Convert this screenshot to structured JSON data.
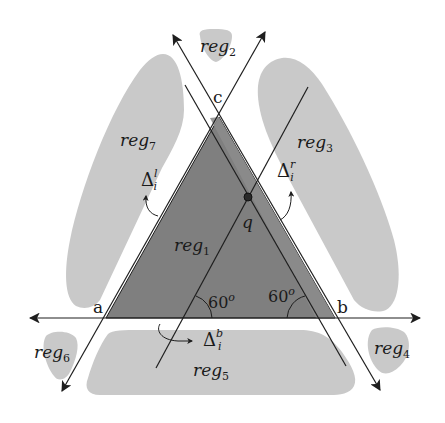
{
  "diagram": {
    "type": "geometric-construction",
    "colors": {
      "background": "#ffffff",
      "region_fill": "#c9c9c9",
      "triangle_fill": "#7f7f7f",
      "triangle_inner_fill": "#8c8c8c",
      "line": "#1e1e1e"
    },
    "vertices": {
      "a": {
        "label": "a",
        "x": 106,
        "y": 318
      },
      "b": {
        "label": "b",
        "x": 335,
        "y": 318
      },
      "c": {
        "label": "c",
        "x": 219,
        "y": 117
      }
    },
    "point_q": {
      "label": "q",
      "x": 248,
      "y": 197
    },
    "regions": [
      {
        "id": "reg1",
        "base": "reg",
        "sub": "1"
      },
      {
        "id": "reg2",
        "base": "reg",
        "sub": "2"
      },
      {
        "id": "reg3",
        "base": "reg",
        "sub": "3"
      },
      {
        "id": "reg4",
        "base": "reg",
        "sub": "4"
      },
      {
        "id": "reg5",
        "base": "reg",
        "sub": "5"
      },
      {
        "id": "reg6",
        "base": "reg",
        "sub": "6"
      },
      {
        "id": "reg7",
        "base": "reg",
        "sub": "7"
      }
    ],
    "deltas": [
      {
        "id": "delta-left",
        "base": "Δ",
        "sub": "i",
        "sup": "l"
      },
      {
        "id": "delta-right",
        "base": "Δ",
        "sub": "i",
        "sup": "r"
      },
      {
        "id": "delta-bottom",
        "base": "Δ",
        "sub": "i",
        "sup": "b"
      }
    ],
    "angles": [
      {
        "id": "angle-left",
        "value": "60",
        "unit": "o"
      },
      {
        "id": "angle-right",
        "value": "60",
        "unit": "o"
      }
    ]
  }
}
